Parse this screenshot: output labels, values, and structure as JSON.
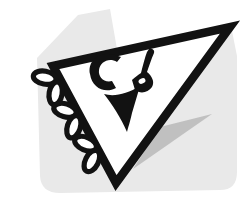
{
  "logo": {
    "monogram": "CP",
    "colors": {
      "ink": "#121212",
      "paper": "#ffffff",
      "shadow_light": "#e9e9e9",
      "shadow_mid": "#b9b9b9"
    }
  }
}
